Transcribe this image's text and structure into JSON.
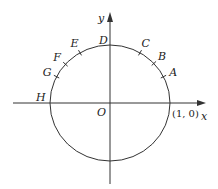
{
  "diagram": {
    "type": "unit-circle",
    "center": {
      "x": 110,
      "y": 103
    },
    "radius": {
      "rx": 60,
      "ry": 58
    },
    "axes": {
      "x_label": "x",
      "y_label": "y",
      "origin_label": "O",
      "unit_point_label": "(1, 0)"
    },
    "top_label": "D",
    "left_label": "H",
    "points": [
      {
        "label": "A",
        "angle_deg": 27
      },
      {
        "label": "B",
        "angle_deg": 43
      },
      {
        "label": "C",
        "angle_deg": 60
      },
      {
        "label": "E",
        "angle_deg": 120
      },
      {
        "label": "F",
        "angle_deg": 138
      },
      {
        "label": "G",
        "angle_deg": 153
      }
    ],
    "colors": {
      "stroke": "#333333",
      "background": "#ffffff"
    }
  }
}
